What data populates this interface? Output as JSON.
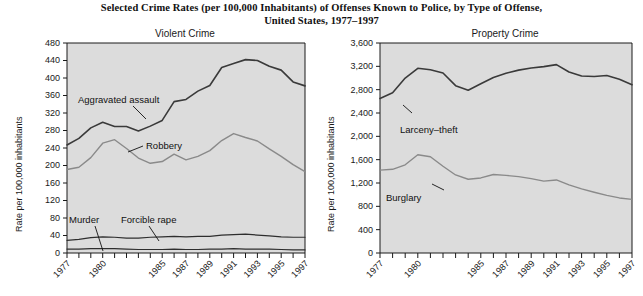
{
  "figure": {
    "title_line1": "Selected Crime Rates (per 100,000 Inhabitants) of Offenses Known to Police, by Type of Offense,",
    "title_line2": "United States, 1977–1997"
  },
  "panels": {
    "left": {
      "title": "Violent Crime",
      "ylabel": "Rate per 100,000 inhabitants"
    },
    "right": {
      "title": "Property Crime",
      "ylabel": "Rate per 100,000 inhabitants"
    }
  },
  "chart_data": [
    {
      "type": "line",
      "title": "Violent Crime",
      "xlabel": "",
      "ylabel": "Rate per 100,000 inhabitants",
      "ylim": [
        0,
        480
      ],
      "ytick_step": 40,
      "yticks": [
        0,
        40,
        80,
        120,
        160,
        200,
        240,
        280,
        320,
        360,
        400,
        440,
        480
      ],
      "ytick_labels": [
        "0",
        "40",
        "80",
        "120",
        "160",
        "200",
        "240",
        "280",
        "320",
        "360",
        "400",
        "440",
        "480"
      ],
      "x": [
        1977,
        1978,
        1979,
        1980,
        1981,
        1982,
        1983,
        1984,
        1985,
        1986,
        1987,
        1988,
        1989,
        1990,
        1991,
        1992,
        1993,
        1994,
        1995,
        1996,
        1997
      ],
      "xtick_labels": [
        "1977",
        "1980",
        "1985",
        "1987",
        "1989",
        "1991",
        "1993",
        "1995",
        "1997"
      ],
      "xtick_values": [
        1977,
        1980,
        1985,
        1987,
        1989,
        1991,
        1993,
        1995,
        1997
      ],
      "grid": false,
      "legend": "inline-annotations",
      "series": [
        {
          "name": "Aggravated assault",
          "color": "#3a3a3a",
          "values": [
            247,
            262,
            286,
            299,
            289,
            289,
            279,
            290,
            303,
            346,
            351,
            370,
            383,
            424,
            433,
            442,
            440,
            427,
            418,
            391,
            382
          ]
        },
        {
          "name": "Robbery",
          "color": "#8a8a8a",
          "values": [
            191,
            196,
            218,
            251,
            259,
            239,
            217,
            205,
            209,
            226,
            213,
            221,
            234,
            257,
            273,
            264,
            256,
            238,
            221,
            202,
            186
          ]
        },
        {
          "name": "Forcible rape",
          "color": "#2e2e2e",
          "values": [
            29,
            31,
            35,
            37,
            36,
            34,
            34,
            36,
            37,
            38,
            37,
            38,
            38,
            41,
            42,
            43,
            41,
            39,
            37,
            36,
            36
          ]
        },
        {
          "name": "Murder",
          "color": "#2e2e2e",
          "values": [
            9,
            9,
            10,
            10,
            10,
            9,
            8,
            8,
            8,
            9,
            8,
            8,
            9,
            9,
            10,
            9,
            9,
            9,
            8,
            7,
            7
          ]
        }
      ],
      "annotations": [
        {
          "label": "Aggravated assault",
          "target_series": "Aggravated assault"
        },
        {
          "label": "Robbery",
          "target_series": "Robbery"
        },
        {
          "label": "Forcible rape",
          "target_series": "Forcible rape"
        },
        {
          "label": "Murder",
          "target_series": "Murder"
        }
      ]
    },
    {
      "type": "line",
      "title": "Property Crime",
      "xlabel": "",
      "ylabel": "Rate per 100,000 inhabitants",
      "ylim": [
        0,
        3600
      ],
      "ytick_step": 400,
      "yticks": [
        0,
        400,
        800,
        1200,
        1600,
        2000,
        2400,
        2800,
        3200,
        3600
      ],
      "ytick_labels": [
        "0",
        "400",
        "800",
        "1,200",
        "1,600",
        "2,000",
        "2,400",
        "2,800",
        "3,200",
        "3,600"
      ],
      "x": [
        1977,
        1978,
        1979,
        1980,
        1981,
        1982,
        1983,
        1984,
        1985,
        1986,
        1987,
        1988,
        1989,
        1990,
        1991,
        1992,
        1993,
        1994,
        1995,
        1996,
        1997
      ],
      "xtick_labels": [
        "1977",
        "1980",
        "1985",
        "1987",
        "1989",
        "1991",
        "1993",
        "1995",
        "1997"
      ],
      "xtick_values": [
        1977,
        1980,
        1985,
        1987,
        1989,
        1991,
        1993,
        1995,
        1997
      ],
      "grid": false,
      "legend": "inline-annotations",
      "series": [
        {
          "name": "Larceny-theft",
          "color": "#3a3a3a",
          "values": [
            2650,
            2747,
            2999,
            3167,
            3140,
            3085,
            2869,
            2791,
            2901,
            3010,
            3081,
            3135,
            3171,
            3195,
            3229,
            3103,
            3033,
            3026,
            3043,
            2980,
            2886
          ]
        },
        {
          "name": "Burglary",
          "color": "#8a8a8a",
          "values": [
            1420,
            1435,
            1512,
            1684,
            1650,
            1488,
            1338,
            1264,
            1287,
            1345,
            1330,
            1309,
            1276,
            1232,
            1252,
            1168,
            1100,
            1042,
            988,
            944,
            919
          ]
        }
      ],
      "annotations": [
        {
          "label": "Larceny–theft",
          "target_series": "Larceny-theft"
        },
        {
          "label": "Burglary",
          "target_series": "Burglary"
        }
      ]
    }
  ]
}
